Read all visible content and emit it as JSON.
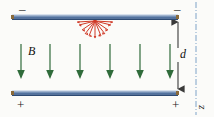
{
  "figure": {
    "width": 214,
    "height": 117,
    "background": "#fbfbf9"
  },
  "colors": {
    "plate_top_highlight": "#b9c6da",
    "plate_mid": "#5b7aa6",
    "plate_dark": "#3f5e8c",
    "plate_end_cap": "#8a6a3a",
    "field_arrow_green": "#2f6b3a",
    "burst_red": "#d03a28",
    "dimension_gray": "#4a4a4a",
    "axis_blue": "#7fa3c8",
    "text": "#111111"
  },
  "plates": {
    "top": {
      "name": "negative plate",
      "charge_symbol_left": "–",
      "charge_symbol_right": "–",
      "x": 12,
      "y": 14,
      "width": 166,
      "height": 6
    },
    "bottom": {
      "name": "positive plate",
      "charge_symbol_left": "+",
      "charge_symbol_right": "+",
      "x": 12,
      "y": 90,
      "width": 166,
      "height": 6
    }
  },
  "field": {
    "label": "B",
    "direction": "down",
    "arrow_count": 6,
    "arrow_x": [
      21,
      50,
      80,
      110,
      140,
      170
    ],
    "arrow_top_y": 44,
    "arrow_height": 36,
    "label_x": 28,
    "label_y": 46
  },
  "burst": {
    "name": "radiating-field-burst",
    "center_x": 95,
    "center_y": 20,
    "ray_count": 11,
    "inner_radius": 3,
    "outer_radius": 16,
    "color": "#d03a28"
  },
  "dimension": {
    "label": "d",
    "label_x": 174,
    "label_y": 52,
    "line_x": 178,
    "top_y": 21,
    "bottom_y": 90
  },
  "axis": {
    "label": "z",
    "label_x": 201,
    "label_y": 104,
    "line_x": 196,
    "top_y": 2,
    "bottom_y": 115,
    "style": "dash-dot"
  },
  "signs": {
    "top_left": {
      "symbol": "–",
      "x": 19,
      "y": 3
    },
    "top_right": {
      "symbol": "–",
      "x": 174,
      "y": 3
    },
    "bottom_left": {
      "symbol": "+",
      "x": 17,
      "y": 99
    },
    "bottom_right": {
      "symbol": "+",
      "x": 172,
      "y": 99
    }
  }
}
